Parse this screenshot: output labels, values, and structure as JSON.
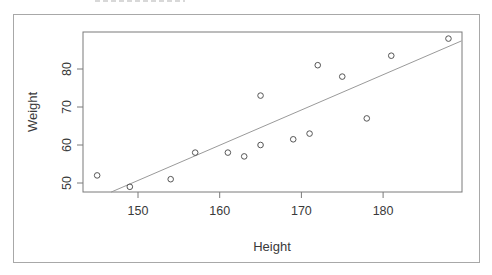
{
  "chart_data": {
    "type": "scatter",
    "title": "",
    "xlabel": "Height",
    "ylabel": "Weight",
    "xlim": [
      144,
      190
    ],
    "ylim": [
      47.5,
      89.5
    ],
    "x_ticks": [
      150,
      160,
      170,
      180
    ],
    "y_ticks": [
      50,
      60,
      70,
      80
    ],
    "grid": false,
    "legend": null,
    "series": [
      {
        "name": "observations",
        "marker": "open-circle",
        "points": [
          {
            "x": 145,
            "y": 52
          },
          {
            "x": 149,
            "y": 49
          },
          {
            "x": 154,
            "y": 51
          },
          {
            "x": 157,
            "y": 58
          },
          {
            "x": 161,
            "y": 58
          },
          {
            "x": 163,
            "y": 57
          },
          {
            "x": 165,
            "y": 73
          },
          {
            "x": 165,
            "y": 60
          },
          {
            "x": 169,
            "y": 61.5
          },
          {
            "x": 171,
            "y": 63
          },
          {
            "x": 172,
            "y": 81
          },
          {
            "x": 175,
            "y": 78
          },
          {
            "x": 178,
            "y": 67
          },
          {
            "x": 181,
            "y": 83.5
          },
          {
            "x": 188,
            "y": 88
          }
        ]
      },
      {
        "name": "regression line",
        "type": "line",
        "points": [
          {
            "x": 146.7,
            "y": 47.6
          },
          {
            "x": 189.6,
            "y": 87.4
          }
        ]
      }
    ]
  },
  "colors": {
    "frame": "#7a7a7a",
    "outer_frame": "#a8a8a8",
    "points": "#555555",
    "line": "#9a9a9a",
    "text": "#3a3a3a"
  }
}
